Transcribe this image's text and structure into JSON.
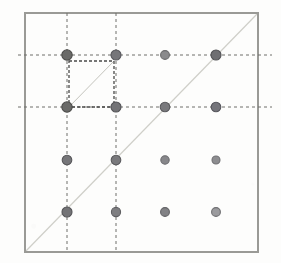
{
  "figure": {
    "background_color": "#fdfdfc"
  },
  "frame": {
    "name": "outer-square-border",
    "x": 25,
    "y": 13,
    "width": 233,
    "height": 239,
    "stroke_color": "#9a9a96",
    "stroke_width": 2.0
  },
  "diagonal": {
    "name": "main-diagonal",
    "x1": 25,
    "y1": 252,
    "x2": 258,
    "y2": 13,
    "stroke_color": "#cfcfc9",
    "stroke_width": 1.2
  },
  "inner_cell": {
    "name": "inner-dashed-square",
    "x": 69,
    "y": 61,
    "width": 45,
    "height": 46,
    "stroke_color": "#4a4a48",
    "stroke_width": 1.3,
    "dash": "3 2"
  },
  "inner_cell_diagonal": {
    "name": "inner-cell-diagonal",
    "x1": 69,
    "y1": 107,
    "x2": 114,
    "y2": 61,
    "stroke_color": "#c4c4bd",
    "stroke_width": 1.0
  },
  "grid": {
    "dash_pattern": "3 3",
    "stroke_color": "#6e6e6a",
    "stroke_width": 1.0,
    "columns_x": [
      67,
      116,
      165,
      216
    ],
    "rows_y": [
      55,
      107,
      160,
      212
    ],
    "vertical_lines": [
      {
        "name": "grid-line-vertical-col1",
        "x": 67,
        "y1": 13,
        "y2": 252
      },
      {
        "name": "grid-line-vertical-col2",
        "x": 116,
        "y1": 13,
        "y2": 252
      }
    ],
    "horizontal_lines": [
      {
        "name": "grid-line-horizontal-row1",
        "y": 55,
        "x1": 18,
        "x2": 272
      },
      {
        "name": "grid-line-horizontal-row2",
        "y": 107,
        "x1": 18,
        "x2": 272
      }
    ]
  },
  "points": [
    {
      "name": "lattice-point-r1c1",
      "cx": 67,
      "cy": 55,
      "r": 5.2,
      "fill": "#6a6a68",
      "stroke": "#4c4c4a"
    },
    {
      "name": "lattice-point-r1c2",
      "cx": 116,
      "cy": 55,
      "r": 5.0,
      "fill": "#76767a",
      "stroke": "#55555a"
    },
    {
      "name": "lattice-point-r1c3",
      "cx": 165,
      "cy": 55,
      "r": 4.4,
      "fill": "#8a8a8c",
      "stroke": "#6b6b6d"
    },
    {
      "name": "lattice-point-r1c4",
      "cx": 216,
      "cy": 55,
      "r": 5.0,
      "fill": "#6f6f72",
      "stroke": "#505053"
    },
    {
      "name": "lattice-point-r2c1",
      "cx": 67,
      "cy": 107,
      "r": 5.2,
      "fill": "#6a6a68",
      "stroke": "#4c4c4a"
    },
    {
      "name": "lattice-point-r2c2",
      "cx": 116,
      "cy": 107,
      "r": 5.0,
      "fill": "#737376",
      "stroke": "#515154"
    },
    {
      "name": "lattice-point-r2c3",
      "cx": 165,
      "cy": 107,
      "r": 4.8,
      "fill": "#79797c",
      "stroke": "#5a5a5d"
    },
    {
      "name": "lattice-point-r2c4",
      "cx": 216,
      "cy": 107,
      "r": 4.8,
      "fill": "#74747a",
      "stroke": "#55555b"
    },
    {
      "name": "lattice-point-r3c1",
      "cx": 67,
      "cy": 160,
      "r": 4.8,
      "fill": "#767679",
      "stroke": "#57575a"
    },
    {
      "name": "lattice-point-r3c2",
      "cx": 116,
      "cy": 160,
      "r": 4.8,
      "fill": "#79797c",
      "stroke": "#5a5a5d"
    },
    {
      "name": "lattice-point-r3c3",
      "cx": 165,
      "cy": 160,
      "r": 4.2,
      "fill": "#87878a",
      "stroke": "#6a6a6d"
    },
    {
      "name": "lattice-point-r3c4",
      "cx": 216,
      "cy": 160,
      "r": 4.0,
      "fill": "#8d8d90",
      "stroke": "#717174"
    },
    {
      "name": "lattice-point-r4c1",
      "cx": 67,
      "cy": 212,
      "r": 5.0,
      "fill": "#737376",
      "stroke": "#535356"
    },
    {
      "name": "lattice-point-r4c2",
      "cx": 116,
      "cy": 212,
      "r": 4.6,
      "fill": "#7e7e81",
      "stroke": "#5f5f62"
    },
    {
      "name": "lattice-point-r4c3",
      "cx": 165,
      "cy": 212,
      "r": 4.4,
      "fill": "#828285",
      "stroke": "#636366"
    },
    {
      "name": "lattice-point-r4c4",
      "cx": 216,
      "cy": 212,
      "r": 4.4,
      "fill": "#9b9b9e",
      "stroke": "#6f6f72"
    }
  ]
}
